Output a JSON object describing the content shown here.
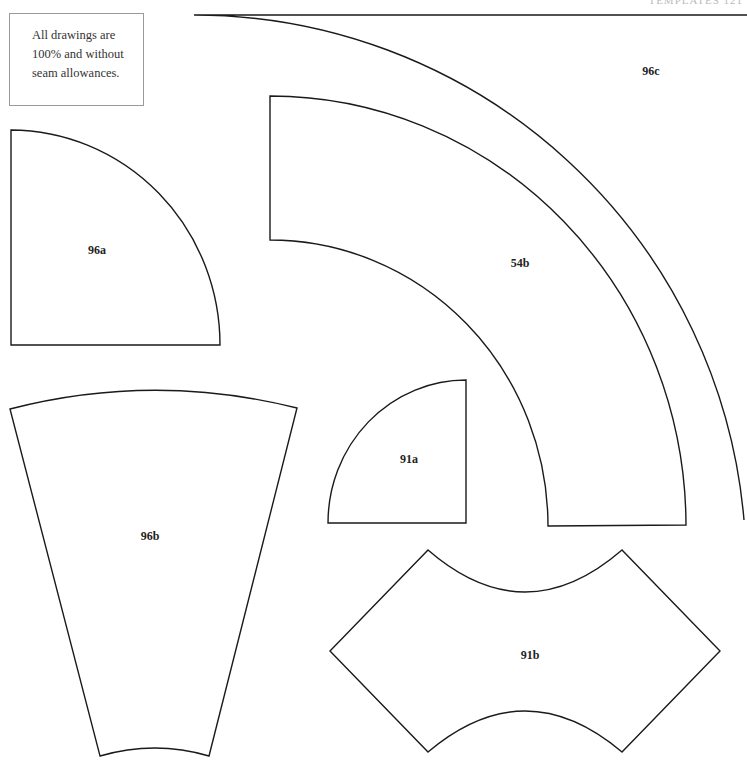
{
  "page": {
    "header_fragment": "TEMPLATES 121",
    "note": {
      "lines": [
        "All drawings are",
        "100% and without",
        "seam allowances."
      ]
    }
  },
  "templates": [
    {
      "id": "96a",
      "label": "96a",
      "shape": "quarter-circle"
    },
    {
      "id": "96b",
      "label": "96b",
      "shape": "wedge"
    },
    {
      "id": "96c",
      "label": "96c",
      "shape": "large-quarter-arc"
    },
    {
      "id": "54b",
      "label": "54b",
      "shape": "arc-band"
    },
    {
      "id": "91a",
      "label": "91a",
      "shape": "quarter-circle"
    },
    {
      "id": "91b",
      "label": "91b",
      "shape": "concave-hexagon"
    }
  ],
  "colors": {
    "line": "#1a1a1a",
    "box_border": "#9a9a9a",
    "background": "#ffffff"
  }
}
